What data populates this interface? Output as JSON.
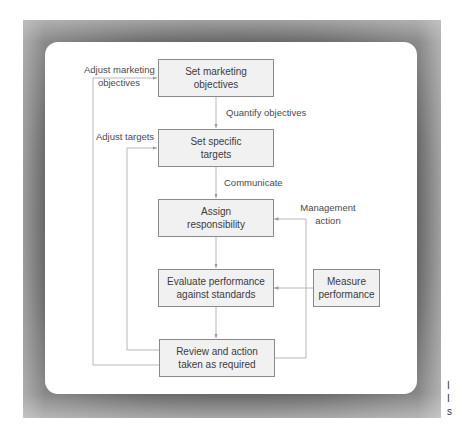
{
  "diagram": {
    "type": "flowchart",
    "boxes": [
      {
        "id": "set-objectives",
        "text": "Set marketing objectives",
        "line1": "Set marketing",
        "line2": "objectives"
      },
      {
        "id": "set-targets",
        "text": "Set specific targets",
        "line1": "Set specific",
        "line2": "targets"
      },
      {
        "id": "assign",
        "text": "Assign responsibility",
        "line1": "Assign",
        "line2": "responsibility"
      },
      {
        "id": "evaluate",
        "text": "Evaluate performance against standards",
        "line1": "Evaluate performance",
        "line2": "against standards"
      },
      {
        "id": "review",
        "text": "Review and action taken as required",
        "line1": "Review and action",
        "line2": "taken as required"
      },
      {
        "id": "measure",
        "text": "Measure performance",
        "line1": "Measure",
        "line2": "performance"
      }
    ],
    "edge_labels": {
      "adjust_objectives_1": "Adjust marketing",
      "adjust_objectives_2": "objectives",
      "quantify": "Quantify objectives",
      "adjust_targets": "Adjust targets",
      "communicate": "Communicate",
      "management_1": "Management",
      "management_2": "action"
    },
    "edges": [
      {
        "from": "set-objectives",
        "to": "set-targets",
        "label": "Quantify objectives"
      },
      {
        "from": "set-targets",
        "to": "assign",
        "label": "Communicate"
      },
      {
        "from": "assign",
        "to": "evaluate",
        "label": ""
      },
      {
        "from": "evaluate",
        "to": "review",
        "label": ""
      },
      {
        "from": "measure",
        "to": "evaluate",
        "label": ""
      },
      {
        "from": "review",
        "to": "assign",
        "label": "Management action"
      },
      {
        "from": "review",
        "to": "set-targets",
        "label": "Adjust targets"
      },
      {
        "from": "review",
        "to": "set-objectives",
        "label": "Adjust marketing objectives"
      }
    ],
    "colors": {
      "box_fill": "#f1f1f1",
      "box_border": "#8a8a8a",
      "line": "#b5b5b5",
      "text": "#3c3c3c",
      "frame": "#5a5a5a"
    }
  },
  "caption_fragment": {
    "line1": "I",
    "line2": "I",
    "line3": "s"
  }
}
